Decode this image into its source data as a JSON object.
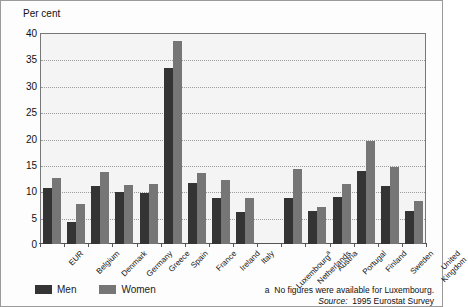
{
  "figure": {
    "ylabel": "Per cent",
    "footnote_marker": "a",
    "footnote": "No figures were available for Luxembourg.",
    "source_label": "Source:",
    "source_value": "1995 Eurostat Survey"
  },
  "legend": {
    "men": "Men",
    "women": "Women"
  },
  "colors": {
    "men": "#343434",
    "women": "#767676",
    "plot_background": "#f4f4f4",
    "gridline": "#9c9c9c",
    "axis": "#555555"
  },
  "chart_data": {
    "type": "bar",
    "title": "",
    "xlabel": "",
    "ylabel": "Per cent",
    "ylim": [
      0,
      40
    ],
    "yticks": [
      0,
      5,
      10,
      15,
      20,
      25,
      30,
      35,
      40
    ],
    "grid": true,
    "legend_position": "bottom-left",
    "categories": [
      "EUR",
      "Belgium",
      "Denmark",
      "Germany",
      "Greece",
      "Spain",
      "France",
      "Ireland",
      "Italy",
      "Luxembourg",
      "Netherlands",
      "Austria",
      "Portugal",
      "Finland",
      "Sweden",
      "United Kingdom"
    ],
    "category_notes": {
      "Luxembourg": "a"
    },
    "series": [
      {
        "name": "Men",
        "values": [
          10.7,
          4.1,
          11.0,
          9.9,
          9.6,
          33.3,
          11.5,
          8.7,
          6.1,
          null,
          8.7,
          6.2,
          8.9,
          13.8,
          11.0,
          6.3
        ]
      },
      {
        "name": "Women",
        "values": [
          12.5,
          7.5,
          13.7,
          11.2,
          11.4,
          38.5,
          13.5,
          12.2,
          8.8,
          null,
          14.3,
          7.0,
          11.3,
          19.5,
          14.6,
          8.2
        ]
      }
    ]
  }
}
